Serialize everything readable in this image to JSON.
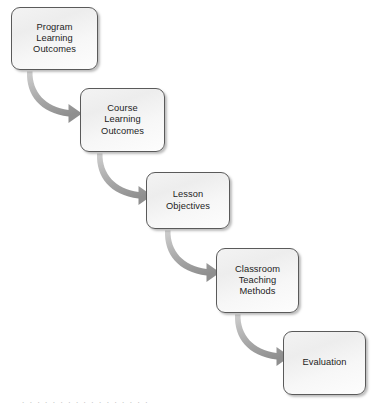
{
  "diagram": {
    "type": "cascading-flowchart",
    "orientation": "top-left to bottom-right staircase",
    "background_color": "#ffffff",
    "node_fill_color": "#f2f2f2",
    "node_border_color": "#5a5a5a",
    "node_text_color": "#1d1d1d",
    "arrow_color": "#9a9a9a",
    "nodes": [
      {
        "id": "program-learning-outcomes",
        "label": "Program\nLearning\nOutcomes",
        "lines": [
          "Program",
          "Learning",
          "Outcomes"
        ],
        "x": 11,
        "y": 7,
        "w": 87,
        "h": 63
      },
      {
        "id": "course-learning-outcomes",
        "label": "Course\nLearning\nOutcomes",
        "lines": [
          "Course",
          "Learning",
          "Outcomes"
        ],
        "x": 80,
        "y": 88,
        "w": 85,
        "h": 64
      },
      {
        "id": "lesson-objectives",
        "label": "Lesson\nObjectives",
        "lines": [
          "Lesson",
          "Objectives"
        ],
        "x": 146,
        "y": 172,
        "w": 84,
        "h": 57
      },
      {
        "id": "classroom-teaching-methods",
        "label": "Classroom\nTeaching\nMethods",
        "lines": [
          "Classroom",
          "Teaching",
          "Methods"
        ],
        "x": 216,
        "y": 248,
        "w": 83,
        "h": 65
      },
      {
        "id": "evaluation",
        "label": "Evaluation",
        "lines": [
          "Evaluation"
        ],
        "x": 283,
        "y": 331,
        "w": 83,
        "h": 64
      }
    ],
    "connectors": [
      {
        "id": "arrow-program-to-course",
        "from": "program-learning-outcomes",
        "to": "course-learning-outcomes",
        "style": "curved-tapered",
        "direction": "down-right"
      },
      {
        "id": "arrow-course-to-lesson",
        "from": "course-learning-outcomes",
        "to": "lesson-objectives",
        "style": "curved-tapered",
        "direction": "down-right"
      },
      {
        "id": "arrow-lesson-to-methods",
        "from": "lesson-objectives",
        "to": "classroom-teaching-methods",
        "style": "curved-tapered",
        "direction": "down-right"
      },
      {
        "id": "arrow-methods-to-evaluation",
        "from": "classroom-teaching-methods",
        "to": "evaluation",
        "style": "curved-tapered",
        "direction": "down-right"
      }
    ],
    "caption_sliver": "partial text row cropped at bottom edge"
  }
}
